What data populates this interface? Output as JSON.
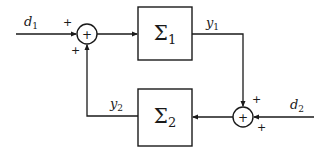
{
  "diagram": {
    "type": "feedback-interconnection",
    "blocks": [
      {
        "id": "sigma1",
        "symbol": "Σ",
        "subscript": "1"
      },
      {
        "id": "sigma2",
        "symbol": "Σ",
        "subscript": "2"
      }
    ],
    "summing_junctions": [
      {
        "id": "sum1",
        "symbol": "+",
        "input_signs": [
          "+",
          "+"
        ]
      },
      {
        "id": "sum2",
        "symbol": "+",
        "input_signs": [
          "+",
          "+"
        ]
      }
    ],
    "signals": {
      "d1": {
        "base": "d",
        "subscript": "1"
      },
      "d2": {
        "base": "d",
        "subscript": "2"
      },
      "y1": {
        "base": "y",
        "subscript": "1"
      },
      "y2": {
        "base": "y",
        "subscript": "2"
      }
    },
    "connections": [
      {
        "from": "d1",
        "to": "sum1",
        "sign": "+"
      },
      {
        "from": "sum1",
        "to": "sigma1"
      },
      {
        "from": "sigma1",
        "to": "sum2",
        "signal": "y1",
        "sign": "+"
      },
      {
        "from": "d2",
        "to": "sum2",
        "sign": "+"
      },
      {
        "from": "sum2",
        "to": "sigma2"
      },
      {
        "from": "sigma2",
        "to": "sum1",
        "signal": "y2",
        "sign": "+"
      }
    ]
  }
}
